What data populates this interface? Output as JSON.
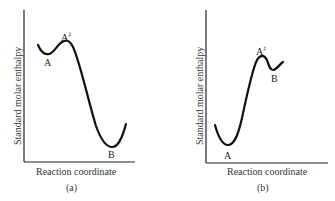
{
  "panels": [
    {
      "id": "a",
      "caption": "(a)",
      "xlabel": "Reaction coordinate",
      "ylabel": "Standard molar enthalpy",
      "points": {
        "reactant": "A",
        "transition_state": "A",
        "transition_state_sup": "‡",
        "product": "B"
      }
    },
    {
      "id": "b",
      "caption": "(b)",
      "xlabel": "Reaction coordinate",
      "ylabel": "Standard molar enthalpy",
      "points": {
        "reactant": "A",
        "transition_state": "A",
        "transition_state_sup": "‡",
        "product": "B"
      }
    }
  ],
  "colors": {
    "curve": "#111111",
    "axis": "#222222",
    "background": "#ffffff"
  }
}
